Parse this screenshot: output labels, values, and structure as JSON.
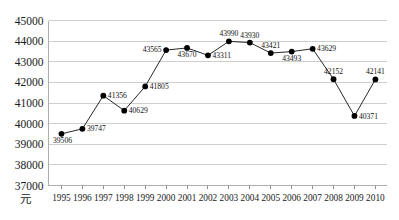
{
  "chart_data": {
    "type": "line",
    "title": "",
    "xlabel": "",
    "ylabel": "",
    "unit_label": "元",
    "categories": [
      "1995",
      "1996",
      "1997",
      "1998",
      "1999",
      "2000",
      "2001",
      "2002",
      "2003",
      "2004",
      "2005",
      "2006",
      "2007",
      "2008",
      "2009",
      "2010"
    ],
    "values": [
      39506,
      39747,
      41356,
      40629,
      41805,
      43565,
      43670,
      43311,
      43990,
      43930,
      43421,
      43493,
      43629,
      42152,
      40371,
      42141
    ],
    "point_labels": [
      "39506",
      "39747",
      "41356",
      "40629",
      "41805",
      "43565",
      "43670",
      "43311",
      "43990",
      "43930",
      "43421",
      "43493",
      "43629",
      "42152",
      "40371",
      "42141"
    ],
    "ylim": [
      37000,
      45000
    ],
    "ytick_step": 1000,
    "ytick_labels": [
      "45000",
      "44000",
      "43000",
      "42000",
      "41000",
      "40000",
      "39000",
      "38000",
      "37000"
    ],
    "ytick_values": [
      45000,
      44000,
      43000,
      42000,
      41000,
      40000,
      39000,
      38000,
      37000
    ],
    "grid": true,
    "grid_axis": "y",
    "legend": false,
    "legend_position": "none",
    "marker": "circle",
    "series_color": "#1c1c1c",
    "marker_color": "#000000",
    "grid_color": "#b9b9b9",
    "background_color": "#ffffff",
    "label_placement": [
      "below-right",
      "right",
      "right",
      "right",
      "right",
      "left",
      "below",
      "right",
      "above",
      "above",
      "above",
      "below",
      "right",
      "above",
      "right",
      "above"
    ]
  }
}
